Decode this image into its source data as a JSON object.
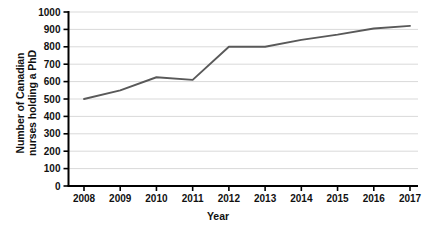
{
  "chart_data": {
    "type": "line",
    "title": "",
    "xlabel": "Year",
    "ylabel": "Number of Canadian nurses holding a PhD",
    "categories": [
      "2008",
      "2009",
      "2010",
      "2011",
      "2012",
      "2013",
      "2014",
      "2015",
      "2016",
      "2017"
    ],
    "x": [
      2008,
      2009,
      2010,
      2011,
      2012,
      2013,
      2014,
      2015,
      2016,
      2017
    ],
    "values": [
      500,
      550,
      625,
      610,
      800,
      800,
      840,
      870,
      905,
      920
    ],
    "series": [
      {
        "name": "Number of Canadian nurses holding a PhD",
        "values": [
          500,
          550,
          625,
          610,
          800,
          800,
          840,
          870,
          905,
          920
        ]
      }
    ],
    "ylim": [
      0,
      1000
    ],
    "yticks": [
      0,
      100,
      200,
      300,
      400,
      500,
      600,
      700,
      800,
      900,
      1000
    ],
    "ytick_labels": [
      "0",
      "100",
      "200",
      "300",
      "400",
      "500",
      "600",
      "700",
      "800",
      "900",
      "1000"
    ],
    "xtick_labels": [
      "2008",
      "2009",
      "2010",
      "2011",
      "2012",
      "2013",
      "2014",
      "2015",
      "2016",
      "2017"
    ],
    "grid": "horizontal",
    "legend": "none",
    "line_color": "#595959",
    "grid_color": "#d9d9d9",
    "axis_color": "#000000",
    "markers": false
  },
  "axis_titles": {
    "y_line1": "Number of Canadian",
    "y_line2": "nurses holding a PhD",
    "x": "Year"
  }
}
